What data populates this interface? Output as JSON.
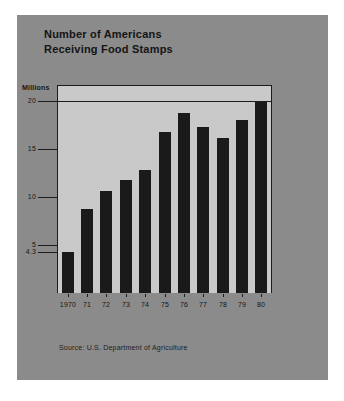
{
  "card": {
    "background_color": "#8b8b8b"
  },
  "title": {
    "line1": "Number of Americans",
    "line2": "Receiving Food Stamps"
  },
  "source_note": "Source: U.S. Department of Agriculture",
  "chart_data": {
    "type": "bar",
    "title": "Number of Americans Receiving Food Stamps",
    "subtitle": "",
    "xlabel": "",
    "ylabel": "Millions",
    "unit_label": "Millions",
    "categories": [
      "1970",
      "71",
      "72",
      "73",
      "74",
      "75",
      "76",
      "77",
      "78",
      "79",
      "80"
    ],
    "values": [
      4.3,
      8.8,
      10.6,
      11.8,
      12.8,
      16.8,
      18.7,
      17.3,
      16.1,
      18.0,
      20.0
    ],
    "ylim": [
      0,
      20
    ],
    "yticks": [
      20,
      15,
      10,
      5,
      4.3
    ],
    "ytick_labels": [
      "20",
      "15",
      "10",
      "5",
      "4.3"
    ],
    "grid": false,
    "legend": null,
    "bar_color": "#1a1a1a",
    "plot_background_color": "#c9c9c9",
    "annotations": []
  }
}
